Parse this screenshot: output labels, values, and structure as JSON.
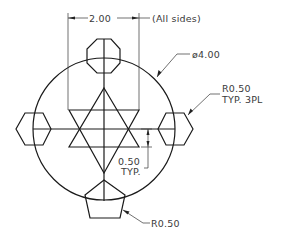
{
  "drawing": {
    "dimensions": {
      "width_dim": {
        "value": "2.00",
        "note": "(All sides)"
      },
      "diameter": {
        "value": "ø4.00"
      },
      "corner_radius_typ": {
        "value": "R0.50",
        "note": "TYP. 3PL"
      },
      "offset": {
        "value": "0.50",
        "note": "TYP."
      },
      "pentagon_radius": {
        "value": "R0.50"
      }
    },
    "shapes": {
      "circle": {
        "cx": 104,
        "cy": 129,
        "r": 71
      },
      "star": "hexagram",
      "top": "octagon",
      "left": "hexagon",
      "right": "hexagon",
      "bottom": "pentagon"
    },
    "colors": {
      "line": "#1a1a1a",
      "text": "#3a3a3a",
      "background": "#ffffff"
    }
  }
}
